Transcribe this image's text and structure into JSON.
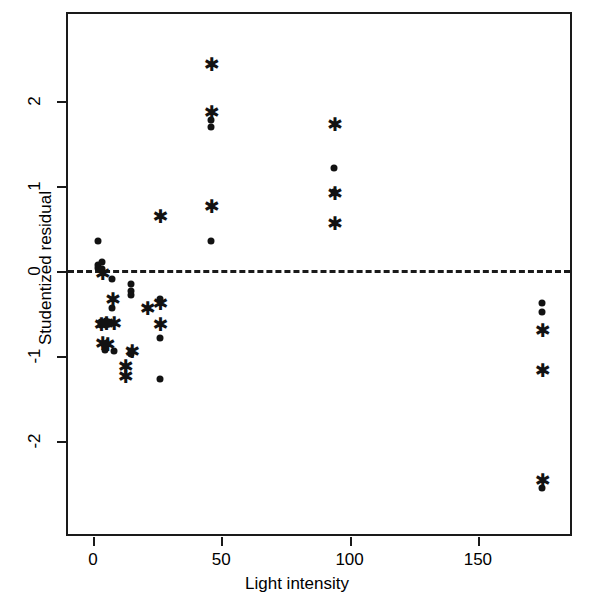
{
  "chart_data": {
    "type": "scatter",
    "title": "",
    "xlabel": "Light intensity",
    "ylabel": "Studentized residual",
    "xlim": [
      -6.8,
      186.6
    ],
    "ylim": [
      -3.05,
      3.05
    ],
    "xticks": [
      0,
      50,
      100,
      150
    ],
    "xtick_labels": [
      "0",
      "50",
      "100",
      "150"
    ],
    "yticks": [
      2,
      1,
      0,
      -1,
      -2
    ],
    "ytick_labels": [
      "2",
      "1",
      "0",
      "-1",
      "-2"
    ],
    "grid": false,
    "legend": "none",
    "annotations": [
      {
        "name": "zero-reference-line",
        "type": "hline",
        "y": 0,
        "style": "dashed"
      }
    ],
    "series": [
      {
        "name": "dot",
        "marker": "filled-circle",
        "color": "#121212",
        "points": [
          {
            "x": 2.0,
            "y": 0.35
          },
          {
            "x": 2.0,
            "y": 0.07
          },
          {
            "x": 2.0,
            "y": 0.04
          },
          {
            "x": 3.5,
            "y": 0.11
          },
          {
            "x": 3.5,
            "y": 0.02
          },
          {
            "x": 3.0,
            "y": -0.6
          },
          {
            "x": 3.0,
            "y": -0.64
          },
          {
            "x": 5.0,
            "y": -0.59
          },
          {
            "x": 5.0,
            "y": -0.63
          },
          {
            "x": 4.5,
            "y": -0.93
          },
          {
            "x": 7.5,
            "y": -0.09
          },
          {
            "x": 7.5,
            "y": -0.43
          },
          {
            "x": 7.5,
            "y": -0.61
          },
          {
            "x": 8.0,
            "y": -0.94
          },
          {
            "x": 15.0,
            "y": -0.15
          },
          {
            "x": 15.0,
            "y": -0.23
          },
          {
            "x": 15.0,
            "y": -0.28
          },
          {
            "x": 15.0,
            "y": -0.94
          },
          {
            "x": 15.0,
            "y": -0.98
          },
          {
            "x": 26.0,
            "y": -0.33
          },
          {
            "x": 26.0,
            "y": -0.79
          },
          {
            "x": 26.0,
            "y": -1.27
          },
          {
            "x": 46.0,
            "y": 1.78
          },
          {
            "x": 46.0,
            "y": 1.69
          },
          {
            "x": 46.0,
            "y": 0.35
          },
          {
            "x": 94.0,
            "y": 1.21
          },
          {
            "x": 94.0,
            "y": 0.93
          },
          {
            "x": 175.0,
            "y": -0.38
          },
          {
            "x": 175.0,
            "y": -0.48
          },
          {
            "x": 175.0,
            "y": -2.55
          }
        ]
      },
      {
        "name": "star",
        "marker": "asterisk",
        "color": "#121212",
        "points": [
          {
            "x": 3.5,
            "y": -0.02
          },
          {
            "x": 3.0,
            "y": -0.62
          },
          {
            "x": 5.0,
            "y": -0.61
          },
          {
            "x": 3.5,
            "y": -0.85
          },
          {
            "x": 5.5,
            "y": -0.86
          },
          {
            "x": 7.5,
            "y": -0.33
          },
          {
            "x": 8.0,
            "y": -0.61
          },
          {
            "x": 12.5,
            "y": -1.12
          },
          {
            "x": 12.5,
            "y": -1.24
          },
          {
            "x": 15.0,
            "y": -0.94
          },
          {
            "x": 21.0,
            "y": -0.44
          },
          {
            "x": 26.0,
            "y": 0.65
          },
          {
            "x": 26.0,
            "y": -0.38
          },
          {
            "x": 26.0,
            "y": -0.62
          },
          {
            "x": 46.0,
            "y": 2.43
          },
          {
            "x": 46.0,
            "y": 1.87
          },
          {
            "x": 46.0,
            "y": 0.76
          },
          {
            "x": 94.0,
            "y": 1.73
          },
          {
            "x": 94.0,
            "y": 0.92
          },
          {
            "x": 94.0,
            "y": 0.57
          },
          {
            "x": 175.0,
            "y": -0.69
          },
          {
            "x": 175.0,
            "y": -1.17
          },
          {
            "x": 175.0,
            "y": -2.46
          }
        ]
      }
    ]
  },
  "axes": {
    "x_title": "Light intensity",
    "y_title": "Studentized residual",
    "x_tick_labels": [
      "0",
      "50",
      "100",
      "150"
    ],
    "y_tick_labels": [
      "2",
      "1",
      "0",
      "-1",
      "-2"
    ]
  }
}
